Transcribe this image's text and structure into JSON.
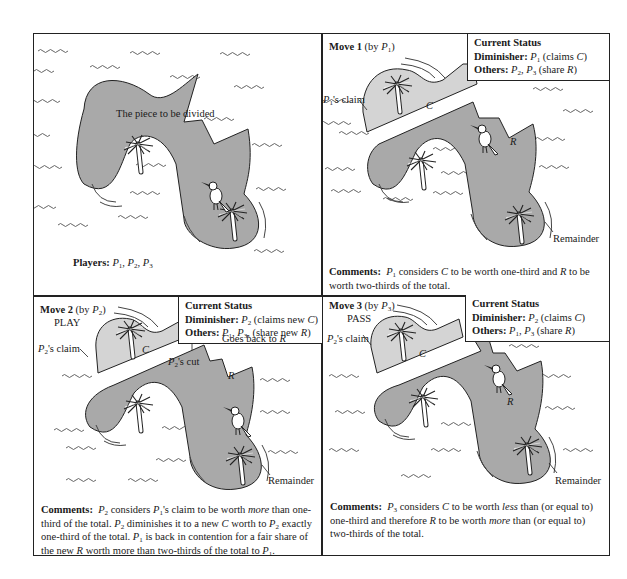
{
  "figure": {
    "panels": [
      {
        "id": "initial",
        "center_label": "The piece to be divided",
        "players_label": "Players:",
        "players": [
          "P",
          "1",
          "P",
          "2",
          "P",
          "3"
        ]
      },
      {
        "id": "move1",
        "move_label": "Move 1",
        "move_by": "(by ",
        "move_player": "P",
        "move_player_sub": "1",
        "move_close": ")",
        "action": "",
        "status": {
          "heading": "Current Status",
          "diminisher_label": "Diminisher:",
          "diminisher_player": "P",
          "diminisher_sub": "1",
          "diminisher_note_pre": "(claims ",
          "diminisher_note_var": "C",
          "diminisher_note_post": ")",
          "others_label": "Others:",
          "others_a": "P",
          "others_a_sub": "2",
          "others_b": "P",
          "others_b_sub": "3",
          "others_note_pre": "(share ",
          "others_note_var": "R",
          "others_note_post": ")"
        },
        "claim_label_player": "P",
        "claim_label_sub": "1",
        "claim_label_text": "'s claim",
        "c_label": "C",
        "r_label": "R",
        "remainder_label": "Remainder",
        "comments_label": "Comments:",
        "comments": "considers C to be worth one-third and R to be worth two-thirds of the total.",
        "comments_parts": [
          "P",
          "1",
          " considers ",
          "C",
          " to be worth one-third and ",
          "R",
          " to be worth two-thirds of the total."
        ]
      },
      {
        "id": "move2",
        "move_label": "Move 2",
        "move_by": "(by ",
        "move_player": "P",
        "move_player_sub": "2",
        "move_close": ")",
        "action": "PLAY",
        "status": {
          "heading": "Current Status",
          "diminisher_label": "Diminisher:",
          "diminisher_player": "P",
          "diminisher_sub": "2",
          "diminisher_note_pre": "(claims new ",
          "diminisher_note_var": "C",
          "diminisher_note_post": ")",
          "others_label": "Others:",
          "others_a": "P",
          "others_a_sub": "1",
          "others_b": "P",
          "others_b_sub": "3",
          "others_note_pre": ", (share new ",
          "others_note_var": "R",
          "others_note_post": ")"
        },
        "claim_label_player": "P",
        "claim_label_sub": "2",
        "claim_label_text": "'s claim",
        "cut_label_player": "P",
        "cut_label_sub": "2",
        "cut_label_text": "'s cut",
        "goes_back_text": "Goes back to ",
        "goes_back_var": "R",
        "c_label": "C",
        "r_label": "R",
        "remainder_label": "Remainder",
        "comments_label": "Comments:",
        "comments_parts": [
          "P",
          "2",
          " considers ",
          "P",
          "1",
          "'s claim to be worth ",
          "more",
          " than one-third of the total. ",
          "P",
          "2",
          " diminishes it to a new ",
          "C",
          " worth to ",
          "P",
          "2",
          " exactly one-third of the total. ",
          "P",
          "1",
          " is back in contention for a fair share of the new ",
          "R",
          " worth more than two-thirds of the total to ",
          "P",
          "1",
          "."
        ]
      },
      {
        "id": "move3",
        "move_label": "Move 3",
        "move_by": "(by ",
        "move_player": "P",
        "move_player_sub": "3",
        "move_close": ")",
        "action": "PASS",
        "status": {
          "heading": "Current Status",
          "diminisher_label": "Diminisher:",
          "diminisher_player": "P",
          "diminisher_sub": "2",
          "diminisher_note_pre": "(claims ",
          "diminisher_note_var": "C",
          "diminisher_note_post": ")",
          "others_label": "Others:",
          "others_a": "P",
          "others_a_sub": "1",
          "others_b": "P",
          "others_b_sub": "3",
          "others_note_pre": "(share ",
          "others_note_var": "R",
          "others_note_post": ")"
        },
        "claim_label_player": "P",
        "claim_label_sub": "2",
        "claim_label_text": "'s claim",
        "c_label": "C",
        "r_label": "R",
        "remainder_label": "Remainder",
        "comments_label": "Comments:",
        "comments_parts": [
          "P",
          "3",
          " considers ",
          "C",
          " to be worth ",
          "less",
          " than (or equal to) one-third and therefore ",
          "R",
          " to be worth ",
          "more",
          " than (or equal to) two-thirds of the total."
        ]
      }
    ],
    "colors": {
      "island_dark": "#a9a9a9",
      "island_light": "#d4d4d4",
      "line": "#222222",
      "wave": "#555555"
    },
    "icons": [
      "palm-tree-icon",
      "toucan-bird-icon",
      "water-wave-icon"
    ]
  }
}
